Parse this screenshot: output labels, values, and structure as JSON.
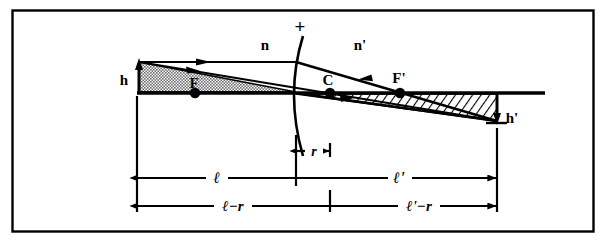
{
  "figure": {
    "type": "optics-ray-diagram",
    "frame": {
      "stroke_color": "#000000",
      "fill_color": "#ffffff",
      "x": 12,
      "y": 10,
      "width": 582,
      "height": 222
    },
    "colors": {
      "ink": "#000000",
      "paper": "#ffffff",
      "object_fill": "#8c8c8c",
      "image_fill": "#ffffff"
    },
    "axis": {
      "name": "optical-axis",
      "y": 93,
      "x_start": 137,
      "x_end": 545
    },
    "labels": {
      "object_height": "h",
      "image_height": "h'",
      "index_left": "n",
      "index_right": "n'",
      "sign_plus": "+",
      "front_focal_point": "F",
      "center_of_curvature": "C",
      "back_focal_point": "F'",
      "object_distance": "ℓ",
      "image_distance": "ℓ'",
      "radius": "r",
      "object_minus_radius": "ℓ−r",
      "image_minus_radius": "ℓ'−r"
    },
    "points": [
      {
        "name": "front-focal-point",
        "label": "F",
        "x": 195,
        "y": 93,
        "label_x": 190,
        "label_y": 85
      },
      {
        "name": "center-of-curvature",
        "label": "C",
        "x": 330,
        "y": 93,
        "label_x": 324,
        "label_y": 82
      },
      {
        "name": "back-focal-point",
        "label": "F'",
        "x": 400,
        "y": 93,
        "label_x": 392,
        "label_y": 80
      }
    ],
    "object": {
      "name": "object-arrow",
      "tip_x": 139,
      "tip_y": 62,
      "base_x": 139,
      "base_y": 93,
      "label": "h",
      "label_x": 124,
      "label_y": 80
    },
    "image": {
      "name": "image-arrow",
      "tip_x": 497,
      "tip_y": 121,
      "base_x": 497,
      "base_y": 93,
      "label": "h'",
      "label_x": 507,
      "label_y": 118
    },
    "surface": {
      "name": "refracting-surface",
      "vertex_x": 296,
      "vertex_y": 93,
      "top_x": 303,
      "top_y": 36,
      "bottom_x": 303,
      "bottom_y": 156,
      "curvature_toward": "right"
    },
    "rays": [
      {
        "name": "incident-parallel-ray",
        "from_x": 139,
        "from_y": 62,
        "to_x": 296,
        "to_y": 62,
        "arrow_at": 0.45
      },
      {
        "name": "incident-chief-ray",
        "from_x": 139,
        "from_y": 62,
        "to_x": 497,
        "to_y": 121,
        "arrow_at": 0.18
      },
      {
        "name": "refracted-ray",
        "from_x": 296,
        "from_y": 62,
        "to_x": 497,
        "to_y": 121,
        "arrow_at": 0.42
      },
      {
        "name": "image-cone-ray",
        "from_x": 296,
        "from_y": 93,
        "to_x": 497,
        "to_y": 121,
        "arrow_at": 0.3
      }
    ],
    "dimensions": [
      {
        "name": "radius-dimension",
        "label": "r",
        "y": 151,
        "x_left": 296,
        "x_right": 330,
        "label_x": 313,
        "label_y": 148,
        "arrows": "both"
      },
      {
        "name": "object-distance-dimension",
        "label": "ℓ",
        "y": 178,
        "x_left": 137,
        "x_right": 296,
        "label_x": 216,
        "label_y": 175
      },
      {
        "name": "image-distance-dimension",
        "label": "ℓ'",
        "y": 178,
        "x_left": 296,
        "x_right": 497,
        "label_x": 398,
        "label_y": 175
      },
      {
        "name": "object-minus-radius-dimension",
        "label": "ℓ−r",
        "y": 206,
        "x_left": 137,
        "x_right": 330,
        "label_x": 229,
        "label_y": 203
      },
      {
        "name": "image-minus-radius-dimension",
        "label": "ℓ'−r",
        "y": 206,
        "x_left": 330,
        "x_right": 497,
        "label_x": 414,
        "label_y": 203
      }
    ],
    "extension_lines": [
      {
        "name": "extension-line-object",
        "x": 137,
        "y_top": 96,
        "y_bottom": 212
      },
      {
        "name": "extension-line-vertex",
        "x": 296,
        "y_top": 135,
        "y_bottom": 186
      },
      {
        "name": "extension-line-center",
        "x": 330,
        "y_top": 143,
        "y_bottom": 212
      },
      {
        "name": "extension-line-image",
        "x": 497,
        "y_top": 128,
        "y_bottom": 212
      }
    ],
    "media_labels": [
      {
        "name": "refractive-index-left",
        "label": "n",
        "x": 265,
        "y": 45
      },
      {
        "name": "refractive-index-right",
        "label": "n'",
        "x": 360,
        "y": 45
      },
      {
        "name": "sign-convention-plus",
        "label": "+",
        "x": 300,
        "y": 28
      }
    ]
  }
}
